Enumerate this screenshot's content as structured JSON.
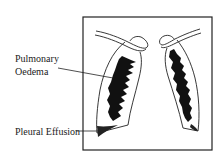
{
  "diagram": {
    "labels": {
      "pulmonary_oedema_line1": "Pulmonary",
      "pulmonary_oedema_line2": "Oedema",
      "pleural_effusion": "Pleural Effusion"
    },
    "colors": {
      "stroke": "#222222",
      "fill_opacity_region": "#111111",
      "background": "#ffffff"
    }
  }
}
